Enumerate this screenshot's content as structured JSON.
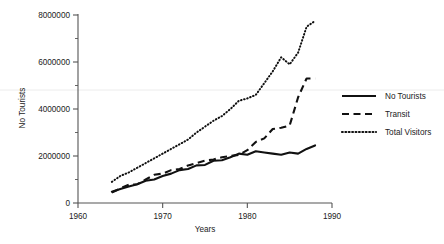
{
  "chart_data": {
    "type": "line",
    "title": "",
    "xlabel": "Years",
    "ylabel": "No Tourists",
    "xlim": [
      1960,
      1990
    ],
    "ylim": [
      0,
      8000000
    ],
    "grid": false,
    "legend_position": "right",
    "x_ticks": [
      "1960",
      "1970",
      "1980",
      "1990"
    ],
    "x_tick_values": [
      1960,
      1970,
      1980,
      1990
    ],
    "y_ticks": [
      "0",
      "2000000",
      "4000000",
      "6000000",
      "8000000"
    ],
    "y_tick_values": [
      0,
      2000000,
      4000000,
      6000000,
      8000000
    ],
    "y_minor_tick_values": [
      1000000,
      3000000,
      5000000,
      7000000
    ],
    "series": [
      {
        "name": "No Tourists",
        "style": "solid",
        "x": [
          1964,
          1965,
          1966,
          1967,
          1968,
          1969,
          1970,
          1971,
          1972,
          1973,
          1974,
          1975,
          1976,
          1977,
          1978,
          1979,
          1980,
          1981,
          1982,
          1983,
          1984,
          1985,
          1986,
          1987,
          1988
        ],
        "values": [
          480000,
          600000,
          700000,
          800000,
          950000,
          1000000,
          1150000,
          1250000,
          1400000,
          1450000,
          1600000,
          1620000,
          1800000,
          1820000,
          1950000,
          2100000,
          2050000,
          2200000,
          2150000,
          2100000,
          2050000,
          2150000,
          2100000,
          2300000,
          2450000
        ]
      },
      {
        "name": "Transit",
        "style": "dashed",
        "x": [
          1964,
          1965,
          1966,
          1967,
          1968,
          1969,
          1970,
          1971,
          1972,
          1973,
          1974,
          1975,
          1976,
          1977,
          1978,
          1979,
          1980,
          1981,
          1982,
          1983,
          1984,
          1985,
          1986,
          1987,
          1988
        ],
        "values": [
          450000,
          620000,
          780000,
          800000,
          1000000,
          1200000,
          1250000,
          1400000,
          1450000,
          1600000,
          1700000,
          1800000,
          1850000,
          1950000,
          2000000,
          2050000,
          2250000,
          2600000,
          2750000,
          3150000,
          3200000,
          3300000,
          4500000,
          5300000,
          5300000
        ]
      },
      {
        "name": "Total Visitors",
        "style": "dotted",
        "x": [
          1964,
          1965,
          1966,
          1967,
          1968,
          1969,
          1970,
          1971,
          1972,
          1973,
          1974,
          1975,
          1976,
          1977,
          1978,
          1979,
          1980,
          1981,
          1982,
          1983,
          1984,
          1985,
          1986,
          1987,
          1988
        ],
        "values": [
          900000,
          1150000,
          1300000,
          1500000,
          1700000,
          1900000,
          2100000,
          2300000,
          2500000,
          2700000,
          3000000,
          3250000,
          3500000,
          3700000,
          4000000,
          4350000,
          4450000,
          4600000,
          5100000,
          5600000,
          6200000,
          5900000,
          6400000,
          7500000,
          7750000
        ]
      }
    ],
    "legend_entries": [
      {
        "label": "No Tourists",
        "style": "solid"
      },
      {
        "label": "Transit",
        "style": "dashed"
      },
      {
        "label": "Total Visitors",
        "style": "dotted"
      }
    ]
  }
}
